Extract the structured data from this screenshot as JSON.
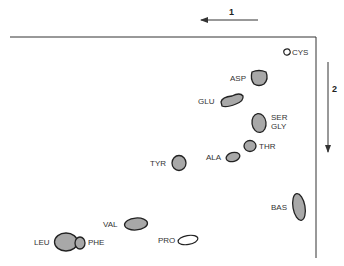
{
  "diagram": {
    "type": "2D chromatogram of amino acids",
    "directions": [
      {
        "label": "1",
        "direction": "right-to-left"
      },
      {
        "label": "2",
        "direction": "top-to-bottom"
      }
    ],
    "spots": [
      {
        "label": "CYS",
        "filled": false
      },
      {
        "label": "ASP",
        "filled": true
      },
      {
        "label": "GLU",
        "filled": true
      },
      {
        "label": "SER",
        "filled": true
      },
      {
        "label": "GLY",
        "filled": true
      },
      {
        "label": "THR",
        "filled": true
      },
      {
        "label": "ALA",
        "filled": true
      },
      {
        "label": "TYR",
        "filled": true
      },
      {
        "label": "BAS",
        "filled": true
      },
      {
        "label": "VAL",
        "filled": true
      },
      {
        "label": "LEU",
        "filled": true
      },
      {
        "label": "PHE",
        "filled": true
      },
      {
        "label": "PRO",
        "filled": false
      }
    ],
    "colors": {
      "spot_fill": "#a8a8a8",
      "outline": "#222222",
      "background": "#ffffff"
    }
  }
}
